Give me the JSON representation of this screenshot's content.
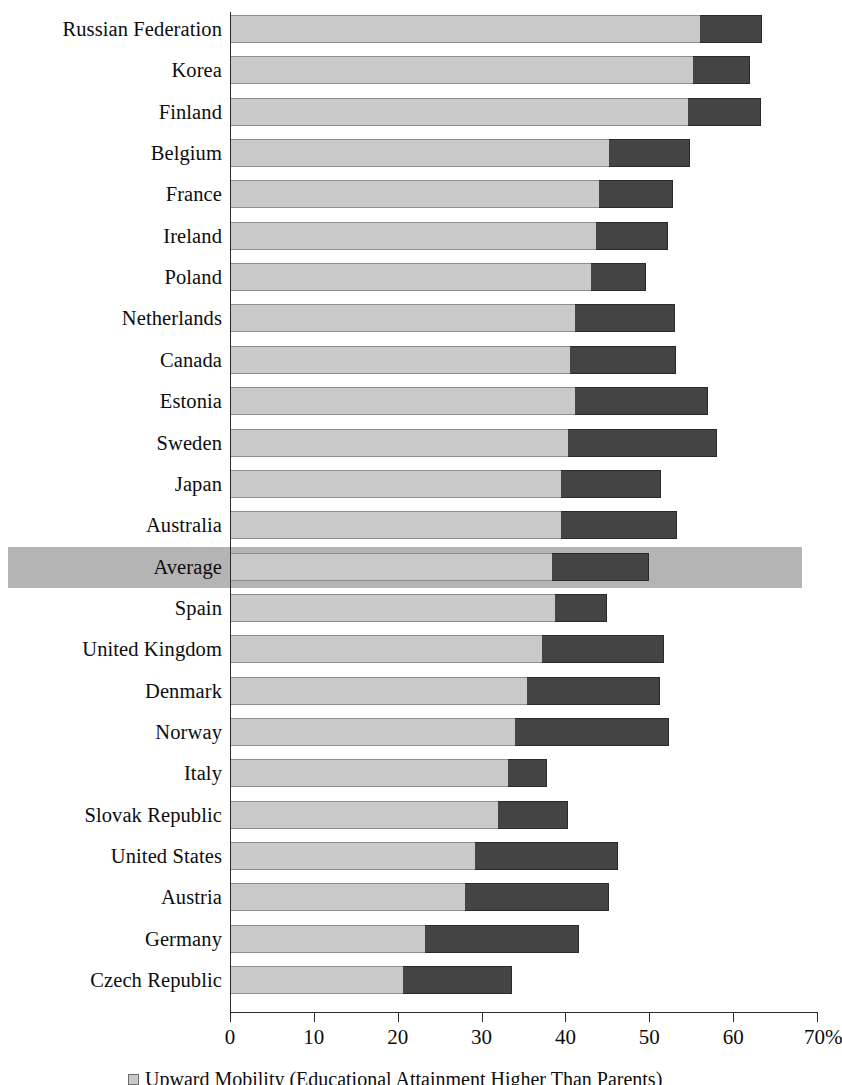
{
  "chart_data": {
    "type": "bar",
    "orientation": "horizontal",
    "stacked": true,
    "title": "",
    "xlabel": "",
    "ylabel": "",
    "xlim": [
      0,
      70
    ],
    "xunit": "%",
    "grid": false,
    "legend_position": "bottom",
    "tick_labels": [
      "0",
      "10",
      "20",
      "30",
      "40",
      "50",
      "60",
      "70%"
    ],
    "tick_values": [
      0,
      10,
      20,
      30,
      40,
      50,
      60,
      70
    ],
    "categories": [
      "Russian Federation",
      "Korea",
      "Finland",
      "Belgium",
      "France",
      "Ireland",
      "Poland",
      "Netherlands",
      "Canada",
      "Estonia",
      "Sweden",
      "Japan",
      "Australia",
      "Average",
      "Spain",
      "United Kingdom",
      "Denmark",
      "Norway",
      "Italy",
      "Slovak Republic",
      "United States",
      "Austria",
      "Germany",
      "Czech Republic"
    ],
    "highlighted_category": "Average",
    "series": [
      {
        "name": "Upward Mobility (Educational Attainment Higher Than Parents)",
        "color": "#c9c9c9",
        "values": [
          56.0,
          55.2,
          54.6,
          45.2,
          44.0,
          43.6,
          43.0,
          41.2,
          40.5,
          41.2,
          40.3,
          39.5,
          39.5,
          38.4,
          38.7,
          37.2,
          35.4,
          34.0,
          33.2,
          31.9,
          29.2,
          28.0,
          23.3,
          20.6
        ]
      },
      {
        "name": "Downward Mobility (Educational Attainment Lower Than Parents)",
        "color": "#444444",
        "values": [
          7.5,
          6.8,
          8.7,
          9.7,
          8.8,
          8.6,
          6.6,
          11.9,
          12.7,
          15.8,
          17.8,
          11.9,
          13.8,
          11.6,
          6.3,
          14.6,
          15.9,
          18.3,
          4.6,
          8.4,
          17.1,
          17.2,
          18.3,
          13.0
        ]
      }
    ],
    "totals": [
      63.5,
      62.0,
      63.3,
      54.9,
      52.8,
      52.2,
      49.6,
      53.1,
      53.2,
      57.0,
      58.1,
      51.4,
      53.3,
      50.0,
      45.0,
      51.8,
      51.3,
      52.3,
      37.8,
      40.3,
      46.3,
      45.2,
      41.6,
      33.6
    ]
  },
  "legend": {
    "items": [
      {
        "swatch": "light",
        "label": "Upward Mobility (Educational Attainment Higher Than Parents)"
      }
    ]
  }
}
